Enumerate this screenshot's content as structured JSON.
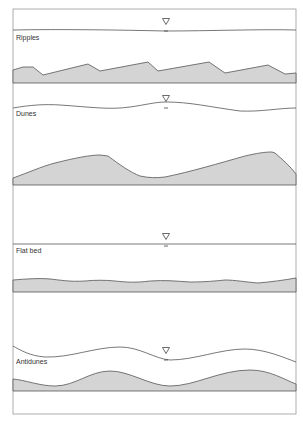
{
  "diagram": {
    "frame": {
      "x": 13,
      "y": 9,
      "width": 283,
      "height": 405,
      "stroke": "#9a9a9a"
    },
    "colors": {
      "sediment_fill": "#d4d4d4",
      "line": "#555555",
      "label": "#333333",
      "background": "#ffffff"
    },
    "water_surface_symbol": "inverted-triangle",
    "panels": [
      {
        "label": "Ripples",
        "label_pos": [
          16,
          40
        ],
        "symbol_pos": [
          166,
          22
        ],
        "water_path": "M13,30 C60,29 120,30 166,31 C210,31 260,29 296,30",
        "bed_path": "M13,70 L23,67 L33,67 L43,75 L88,64 L100,71 L148,62 L158,71 L209,62 L225,73 L268,65 L285,74 L296,73 L296,83 L13,83 Z"
      },
      {
        "label": "Dunes",
        "label_pos": [
          16,
          116
        ],
        "symbol_pos": [
          166,
          99
        ],
        "water_path": "M13,108 C30,105 45,104 60,105 C90,107 110,110 130,107 C145,105 155,102 166,102 C190,102 210,107 240,111 C260,112 280,108 296,108",
        "bed_path": "M13,178 C30,172 40,167 55,163 C75,158 90,155 100,155 L108,156 C120,165 130,172 140,176 C150,178 155,178 165,177 C190,172 220,163 245,156 C258,153 265,152 272,152 L275,153 C283,160 290,166 296,174 L296,185 L13,185 Z"
      },
      {
        "label": "Flat bed",
        "label_pos": [
          16,
          253
        ],
        "symbol_pos": [
          166,
          237
        ],
        "water_path": "M13,244 C80,244 140,244 166,244 C220,244 260,244 296,244",
        "bed_path": "M13,280 C25,279 40,278 50,279 C60,280 70,282 85,281 C95,280 105,280 115,281 C125,282 135,283 150,281 C165,280 175,281 190,282 C205,282 215,281 225,280 C235,280 245,282 258,283 C270,282 285,280 296,278 L296,292 L13,292 Z"
      },
      {
        "label": "Antidunes",
        "label_pos": [
          16,
          364
        ],
        "symbol_pos": [
          166,
          351
        ],
        "water_path": "M13,346 C20,350 30,356 45,357 C70,358 95,347 120,347 C140,347 155,359 170,360 C195,360 220,349 245,349 C265,349 285,358 296,362",
        "bed_path": "M13,379 C25,380 40,386 55,386 C75,386 90,371 110,371 C130,371 150,386 170,386 C195,386 220,370 250,370 C270,370 285,380 296,384 L296,391 L13,391 Z"
      }
    ]
  }
}
